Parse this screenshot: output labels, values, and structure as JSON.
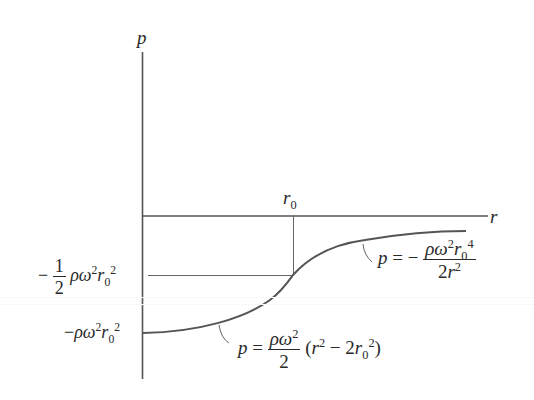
{
  "diagram": {
    "axes": {
      "y_label": "p",
      "x_label": "r",
      "x_mark_label": "r",
      "x_mark_sub": "0"
    },
    "y_marks": {
      "half": {
        "minus": "−",
        "frac_num": "1",
        "frac_den": "2",
        "rest": "ρω",
        "exp1": "2",
        "r": "r",
        "sub": "0",
        "exp2": "2"
      },
      "full": {
        "minus": "−",
        "rest": "ρω",
        "exp1": "2",
        "r": "r",
        "sub": "0",
        "exp2": "2"
      }
    },
    "formula_inner": {
      "lhs": "p",
      "eq": "=",
      "num_a": "ρω",
      "num_exp": "2",
      "den": "2",
      "paren_open": "(",
      "r": "r",
      "r_exp": "2",
      "minus": "−",
      "coef": "2",
      "r0": "r",
      "r0_sub": "0",
      "r0_exp": "2",
      "paren_close": ")"
    },
    "formula_outer": {
      "lhs": "p",
      "eq": "=",
      "minus": "−",
      "num_a": "ρω",
      "num_exp": "2",
      "num_r": "r",
      "num_sub": "0",
      "num_exp2": "4",
      "den_coef": "2",
      "den_r": "r",
      "den_exp": "2"
    },
    "colors": {
      "ink": "#2a2a2a",
      "curve": "#555555",
      "guide": "#666666",
      "background": "#ffffff"
    }
  }
}
